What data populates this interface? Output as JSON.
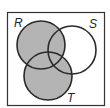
{
  "diagram": {
    "type": "venn",
    "sets": [
      {
        "label": "R",
        "cx": 41,
        "cy": 45,
        "r": 24
      },
      {
        "label": "S",
        "cx": 72,
        "cy": 50,
        "r": 24
      },
      {
        "label": "T",
        "cx": 48,
        "cy": 76,
        "r": 24
      }
    ],
    "shaded_region": "R ∪ T",
    "colors": {
      "shade": "#b4b4b4",
      "stroke": "#2a2a2a",
      "background": "#ffffff"
    }
  },
  "labels": {
    "r": "R",
    "s": "S",
    "t": "T"
  }
}
